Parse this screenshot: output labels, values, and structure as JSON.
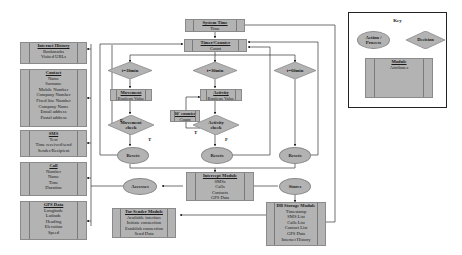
{
  "colors": {
    "fill": "#b3b3b3",
    "stroke": "#8a8a8a",
    "line": "#333333"
  },
  "key": {
    "title": "Key",
    "action": "Action / Process",
    "decision": "Decision",
    "module_title": "Module",
    "module_attr": "Attributes"
  },
  "left_modules": [
    {
      "title": "Internet History",
      "attrs": [
        "Bookmarks",
        "Visited URLs"
      ]
    },
    {
      "title": "Contact",
      "attrs": [
        "Name",
        "Surname",
        "Mobile Number",
        "Company Number",
        "Fixed line Number",
        "Company Name",
        "Email address",
        "Postal address"
      ]
    },
    {
      "title": "SMS",
      "attrs": [
        "Text",
        "Time received/send",
        "Sender/Recipient"
      ]
    },
    {
      "title": "Call",
      "attrs": [
        "Number",
        "Name",
        "Time",
        "Duration"
      ]
    },
    {
      "title": "GPS Data",
      "attrs": [
        "Longitude",
        "Latitude",
        "Heading",
        "Elevation",
        "Speed"
      ]
    }
  ],
  "system_time": {
    "title": "System Time",
    "attrs": [
      "Time"
    ]
  },
  "timer": {
    "title": "Timer/Counter",
    "attrs": [
      "Count"
    ]
  },
  "decisions": {
    "t10": "t=10min",
    "t30": "t=30min",
    "t60": "t=60min",
    "movement_check": "Movement check",
    "activity_check": "Activity check"
  },
  "movement": {
    "title": "Movement",
    "attrs": [
      "Boolean Value"
    ]
  },
  "activity": {
    "title": "Activity",
    "attrs": [
      "Boolean Value"
    ]
  },
  "counter30": {
    "title": "30' counter",
    "attrs": [
      "Count"
    ]
  },
  "actions": {
    "reset1": "Resets",
    "reset2": "Resets",
    "reset3": "Resets",
    "accesses": "Accesses",
    "stores": "Stores"
  },
  "edge_labels": {
    "f1": "F",
    "t1": "T",
    "t2": "T",
    "f2": "F"
  },
  "intercept": {
    "title": "Intercept Module",
    "attrs": [
      "SMSs",
      "Calls",
      "Contacts",
      "GPS Data"
    ]
  },
  "tor": {
    "title": "Tor Sender Module",
    "attrs": [
      "Available interface",
      "Initiate connection",
      "Establish connection",
      "Send Data"
    ]
  },
  "db": {
    "title": "DB Storage Module",
    "attrs": [
      "Timestamp",
      "SMS List",
      "Calls List",
      "Contact List",
      "GPS Data",
      "Internet History"
    ]
  }
}
